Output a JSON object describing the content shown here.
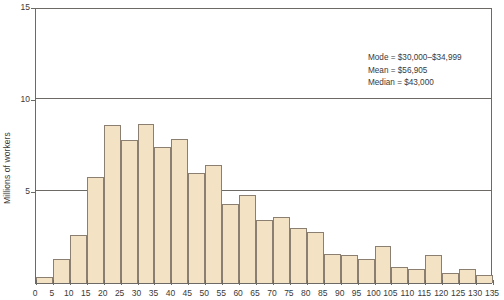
{
  "chart_data": {
    "type": "bar",
    "title": "",
    "subtitle": "",
    "xlabel": "",
    "ylabel": "Millions of workers",
    "xlim": [
      0,
      135
    ],
    "ylim": [
      0,
      15
    ],
    "grid": true,
    "legend": null,
    "bin_width": 5,
    "x_unit": "thousands of dollars (annual income)",
    "y_unit": "millions of workers",
    "xticks": [
      0,
      5,
      10,
      15,
      20,
      25,
      30,
      35,
      40,
      45,
      50,
      55,
      60,
      65,
      70,
      75,
      80,
      85,
      90,
      95,
      100,
      105,
      110,
      115,
      120,
      125,
      130,
      135
    ],
    "yticks": [
      5,
      10,
      15
    ],
    "categories": [
      "0-5",
      "5-10",
      "10-15",
      "15-20",
      "20-25",
      "25-30",
      "30-35",
      "35-40",
      "40-45",
      "45-50",
      "50-55",
      "55-60",
      "60-65",
      "65-70",
      "70-75",
      "75-80",
      "80-85",
      "85-90",
      "90-95",
      "95-100",
      "100-105",
      "105-110",
      "110-115",
      "115-120",
      "120-125",
      "125-130",
      "130-135"
    ],
    "bin_starts": [
      0,
      5,
      10,
      15,
      20,
      25,
      30,
      35,
      40,
      45,
      50,
      55,
      60,
      65,
      70,
      75,
      80,
      85,
      90,
      95,
      100,
      105,
      110,
      115,
      120,
      125,
      130
    ],
    "values": [
      0.35,
      1.3,
      2.6,
      5.75,
      8.6,
      7.75,
      8.65,
      7.4,
      7.85,
      6.0,
      6.4,
      4.3,
      4.8,
      3.4,
      3.6,
      3.0,
      2.75,
      1.6,
      1.5,
      1.3,
      2.0,
      0.85,
      0.75,
      1.5,
      0.55,
      0.75,
      0.45
    ],
    "annotations": [
      "Mode = $30,000–$34,999",
      "Mean = $56,905",
      "Median = $43,000"
    ],
    "colors": {
      "bar_fill": "#f4e2c4",
      "bar_stroke": "#8a7f71",
      "axis": "#6d6a66",
      "text": "#3a3a3a",
      "background": "#ffffff"
    }
  },
  "stats": {
    "mode_label": "Mode = $30,000–$34,999",
    "mean_label": "Mean = $56,905",
    "median_label": "Median = $43,000"
  }
}
